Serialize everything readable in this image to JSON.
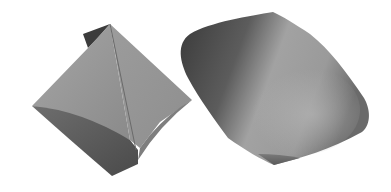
{
  "image": {
    "description": "Two gray 3D-rendered solids on a white background",
    "background_color": "#ffffff",
    "objects": [
      {
        "name": "left-solid",
        "shape": "twisted octahedron-like polyhedron",
        "tones": [
          "#9a9a9a",
          "#7c7c7c",
          "#5a5a5a",
          "#3a3a3a"
        ]
      },
      {
        "name": "right-solid",
        "shape": "rounded cone-like solid",
        "tones": [
          "#a8a8a8",
          "#8a8a8a",
          "#4a4a4a",
          "#2e2e2e"
        ]
      }
    ]
  }
}
